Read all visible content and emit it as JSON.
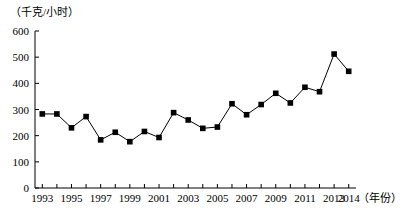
{
  "chart_data": {
    "type": "line",
    "title": "",
    "subtitle": "",
    "xlabel": "（年份）",
    "ylabel": "（千克/小时）",
    "xlim": [
      1992.5,
      2014.5
    ],
    "ylim": [
      0,
      600
    ],
    "grid": false,
    "legend": "none",
    "marker": "filled-square",
    "line_color": "#000000",
    "marker_color": "#000000",
    "axis_color": "#000000",
    "y_ticks": [
      0,
      100,
      200,
      300,
      400,
      500,
      600
    ],
    "y_tick_labels": [
      "0",
      "100",
      "200",
      "300",
      "400",
      "500",
      "600"
    ],
    "x_tick_labels": [
      "1993",
      "1995",
      "1997",
      "1999",
      "2001",
      "2003",
      "2005",
      "2007",
      "2009",
      "2011",
      "2013",
      "2014"
    ],
    "x": [
      1993,
      1994,
      1995,
      1996,
      1997,
      1998,
      1999,
      2000,
      2001,
      2002,
      2003,
      2004,
      2005,
      2006,
      2007,
      2008,
      2009,
      2010,
      2011,
      2012,
      2013,
      2014
    ],
    "categories": [
      "1993",
      "1994",
      "1995",
      "1996",
      "1997",
      "1998",
      "1999",
      "2000",
      "2001",
      "2002",
      "2003",
      "2004",
      "2005",
      "2006",
      "2007",
      "2008",
      "2009",
      "2010",
      "2011",
      "2012",
      "2013",
      "2014"
    ],
    "values": [
      283,
      283,
      230,
      273,
      184,
      213,
      177,
      216,
      193,
      288,
      260,
      228,
      233,
      322,
      280,
      319,
      362,
      325,
      385,
      368,
      512,
      446
    ],
    "series": [
      {
        "name": "",
        "values": [
          283,
          283,
          230,
          273,
          184,
          213,
          177,
          216,
          193,
          288,
          260,
          228,
          233,
          322,
          280,
          319,
          362,
          325,
          385,
          368,
          512,
          446
        ]
      }
    ]
  },
  "axes": {
    "y_unit": "（千克/小时）",
    "x_unit": "（年份）"
  },
  "caption": {
    "text": ""
  }
}
